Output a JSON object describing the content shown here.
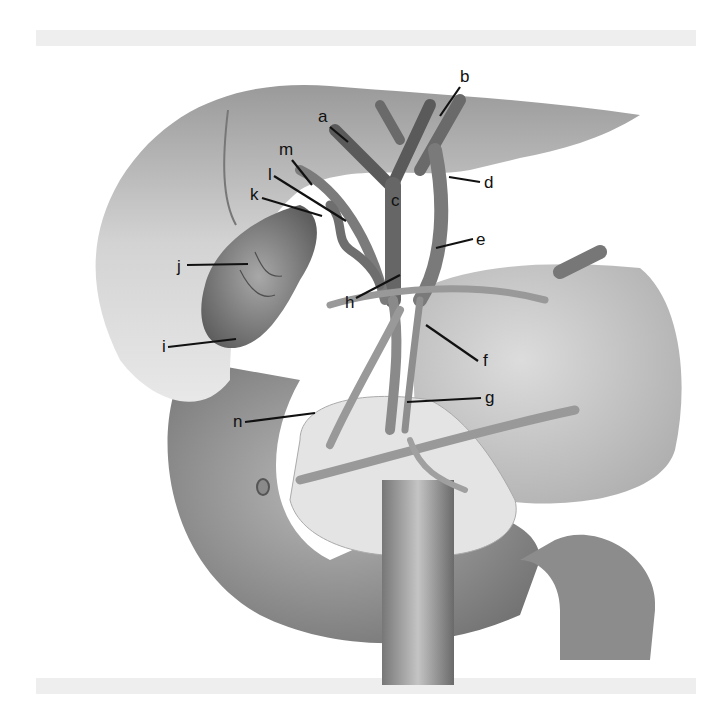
{
  "figure": {
    "labels": [
      {
        "id": "a",
        "text": "a",
        "x": 318,
        "y": 122,
        "lx1": 330,
        "ly1": 127,
        "lx2": 348,
        "ly2": 142
      },
      {
        "id": "b",
        "text": "b",
        "x": 460,
        "y": 82,
        "lx1": 460,
        "ly1": 87,
        "lx2": 440,
        "ly2": 116
      },
      {
        "id": "c",
        "text": "c",
        "x": 391,
        "y": 206,
        "lx1": 0,
        "ly1": 0,
        "lx2": 0,
        "ly2": 0
      },
      {
        "id": "d",
        "text": "d",
        "x": 484,
        "y": 188,
        "lx1": 480,
        "ly1": 182,
        "lx2": 449,
        "ly2": 177
      },
      {
        "id": "e",
        "text": "e",
        "x": 476,
        "y": 245,
        "lx1": 473,
        "ly1": 239,
        "lx2": 436,
        "ly2": 248
      },
      {
        "id": "f",
        "text": "f",
        "x": 483,
        "y": 366,
        "lx1": 478,
        "ly1": 361,
        "lx2": 426,
        "ly2": 325
      },
      {
        "id": "g",
        "text": "g",
        "x": 485,
        "y": 403,
        "lx1": 481,
        "ly1": 398,
        "lx2": 407,
        "ly2": 402
      },
      {
        "id": "h",
        "text": "h",
        "x": 345,
        "y": 308,
        "lx1": 356,
        "ly1": 298,
        "lx2": 400,
        "ly2": 275
      },
      {
        "id": "i",
        "text": "i",
        "x": 162,
        "y": 352,
        "lx1": 168,
        "ly1": 347,
        "lx2": 236,
        "ly2": 339
      },
      {
        "id": "j",
        "text": "j",
        "x": 177,
        "y": 272,
        "lx1": 187,
        "ly1": 265,
        "lx2": 248,
        "ly2": 264
      },
      {
        "id": "k",
        "text": "k",
        "x": 250,
        "y": 200,
        "lx1": 262,
        "ly1": 198,
        "lx2": 322,
        "ly2": 216
      },
      {
        "id": "l",
        "text": "l",
        "x": 268,
        "y": 180,
        "lx1": 274,
        "ly1": 176,
        "lx2": 346,
        "ly2": 221
      },
      {
        "id": "m",
        "text": "m",
        "x": 279,
        "y": 155,
        "lx1": 292,
        "ly1": 160,
        "lx2": 312,
        "ly2": 185
      },
      {
        "id": "n",
        "text": "n",
        "x": 233,
        "y": 427,
        "lx1": 245,
        "ly1": 422,
        "lx2": 315,
        "ly2": 413
      }
    ]
  },
  "colors": {
    "background": "#ffffff",
    "band": "#eeeeee",
    "liver": "#c9c9c9",
    "liver_dark": "#8e8e8e",
    "duct_dark": "#5f5f5f",
    "duct_mid": "#7d7d7d",
    "gallbladder": "#8a8a8a",
    "pancreas": "#e2e2e2",
    "duodenum": "#8f8f8f",
    "stomach": "#cfcfcf",
    "label": "#111111"
  }
}
